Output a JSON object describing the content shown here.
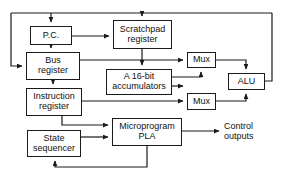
{
  "diagram": {
    "stroke_color": "#1a1a1a",
    "background_color": "#ffffff",
    "text_color": "#111111",
    "width": 291,
    "height": 178,
    "blocks": [
      {
        "id": "pc",
        "label": "P.C.",
        "x": 30,
        "y": 26,
        "w": 42,
        "h": 19,
        "font_size": 9
      },
      {
        "id": "bus_register",
        "label": "Bus\nregister",
        "x": 26,
        "y": 52,
        "w": 54,
        "h": 28,
        "font_size": 9
      },
      {
        "id": "instruction_register",
        "label": "Instruction\nregister",
        "x": 26,
        "y": 88,
        "w": 56,
        "h": 28,
        "font_size": 9
      },
      {
        "id": "state_sequencer",
        "label": "State\nsequencer",
        "x": 27,
        "y": 130,
        "w": 54,
        "h": 27,
        "font_size": 9
      },
      {
        "id": "scratchpad_register",
        "label": "Scratchpad\nregister",
        "x": 113,
        "y": 20,
        "w": 59,
        "h": 29,
        "font_size": 9
      },
      {
        "id": "accumulators",
        "label": "A 16-bit\naccumulators",
        "x": 106,
        "y": 69,
        "w": 66,
        "h": 26,
        "font_size": 9
      },
      {
        "id": "mux_top",
        "label": "Mux",
        "x": 187,
        "y": 52,
        "w": 29,
        "h": 16,
        "font_size": 9
      },
      {
        "id": "mux_bottom",
        "label": "Mux",
        "x": 187,
        "y": 93,
        "w": 29,
        "h": 17,
        "font_size": 9
      },
      {
        "id": "alu",
        "label": "ALU",
        "x": 228,
        "y": 73,
        "w": 37,
        "h": 17,
        "font_size": 9
      },
      {
        "id": "microprogram_pla",
        "label": "Microprogram\nPLA",
        "x": 112,
        "y": 118,
        "w": 70,
        "h": 28,
        "font_size": 9
      }
    ],
    "free_labels": [
      {
        "id": "control_outputs",
        "text": "Control\noutputs",
        "x": 224,
        "y": 121,
        "font_size": 9
      }
    ],
    "wires": [
      {
        "id": "top-bus-horizontal",
        "from": "bus-left",
        "to": "bus-right",
        "points": "11,13 272,13"
      },
      {
        "id": "bus-left-down-to-bus-register",
        "from": "top-bus",
        "to": "bus_register",
        "points": "11,13 11,66 22,66",
        "arrow": "end"
      },
      {
        "id": "top-bus-down-to-pc",
        "from": "top-bus",
        "to": "pc",
        "points": "51,13 51,22",
        "arrow": "end"
      },
      {
        "id": "top-bus-down-to-scratchpad",
        "from": "top-bus",
        "to": "scratchpad_register",
        "points": "142,13 142,16",
        "arrow": "end"
      },
      {
        "id": "alu-right-up-to-top-bus",
        "from": "alu",
        "to": "top-bus",
        "points": "265,81 272,81 272,13"
      },
      {
        "id": "pc-down-to-bus-register",
        "from": "pc",
        "to": "bus_register",
        "points": "51,45 51,48",
        "arrow": "end"
      },
      {
        "id": "pc-right-to-scratchpad",
        "from": "pc",
        "to": "scratchpad_register",
        "points": "72,36 109,36",
        "arrow": "end"
      },
      {
        "id": "bus-register-down-to-instruction-register",
        "from": "bus_register",
        "to": "instruction_register",
        "points": "53,80 53,84",
        "arrow": "end"
      },
      {
        "id": "bus-register-right-to-mux-top",
        "from": "bus_register",
        "to": "mux_top",
        "points": "80,60 183,60",
        "arrow": "end"
      },
      {
        "id": "scratchpad-down-to-accumulators",
        "from": "scratchpad_register",
        "to": "accumulators",
        "points": "142,49 142,65",
        "arrow": "end"
      },
      {
        "id": "accumulators-right-up-to-mux-top",
        "from": "accumulators",
        "to": "mux_top",
        "points": "172,77 201,77 201,72",
        "arrow": "end"
      },
      {
        "id": "accumulators-right-to-mux-bottom",
        "from": "accumulators",
        "to": "mux_bottom",
        "points": "172,86 183,86",
        "arrow": "end"
      },
      {
        "id": "mux-top-right-down-to-alu",
        "from": "mux_top",
        "to": "alu",
        "points": "216,60 246,60 246,69",
        "arrow": "end"
      },
      {
        "id": "mux-bottom-right-up-to-alu",
        "from": "mux_bottom",
        "to": "alu",
        "points": "216,101 246,101 246,94",
        "arrow": "end"
      },
      {
        "id": "instruction-register-right-to-mux-bottom",
        "from": "instruction_register",
        "to": "mux_bottom",
        "points": "82,101 183,101",
        "arrow": "end"
      },
      {
        "id": "instruction-register-down-to-pla",
        "from": "instruction_register",
        "to": "microprogram_pla",
        "points": "62,116 62,125 108,125",
        "arrow": "end"
      },
      {
        "id": "state-sequencer-right-to-pla",
        "from": "state_sequencer",
        "to": "microprogram_pla",
        "points": "81,137 108,137",
        "arrow": "end"
      },
      {
        "id": "pla-right-to-control-outputs",
        "from": "microprogram_pla",
        "to": "control_outputs",
        "points": "182,131 219,131",
        "arrow": "end"
      },
      {
        "id": "pla-feedback-to-state-sequencer",
        "from": "microprogram_pla",
        "to": "state_sequencer",
        "points": "147,146 147,167 55,167 55,161",
        "arrow": "end"
      }
    ]
  }
}
